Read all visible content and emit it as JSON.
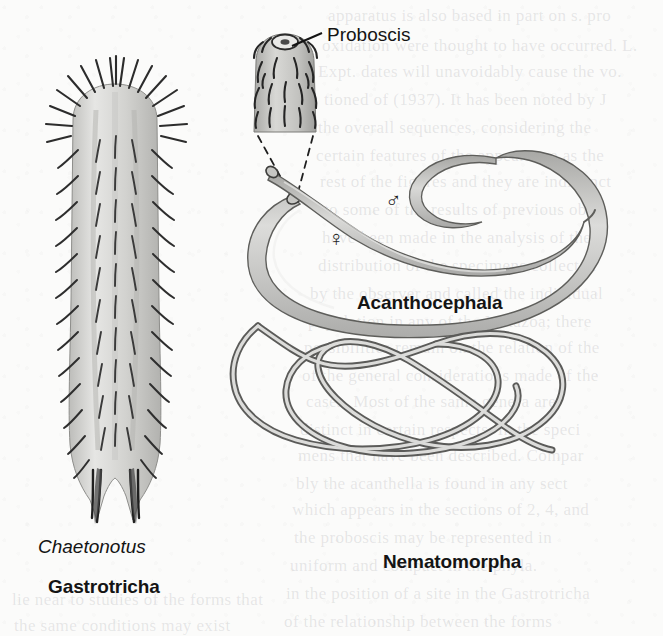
{
  "figure": {
    "background_color": "#fbfbfa",
    "ink_color": "#141414"
  },
  "callouts": [
    {
      "id": "proboscis",
      "text": "Proboscis",
      "x": 327,
      "y": 24
    }
  ],
  "specimens": [
    {
      "id": "gastrotricha",
      "genus_label": "Chaetonotus",
      "genus_x": 38,
      "genus_y": 536,
      "phylum_label": "Gastrotricha",
      "phylum_x": 48,
      "phylum_y": 576,
      "body_color": "#d9d9d7",
      "outline_color": "#3a3a3a"
    },
    {
      "id": "acanthocephala",
      "phylum_label": "Acanthocephala",
      "phylum_x": 357,
      "phylum_y": 292,
      "body_color": "#c9c9c6",
      "outline_color": "#5a5a58",
      "sex_symbols": [
        {
          "sex": "male",
          "glyph": "♂",
          "x": 385,
          "y": 188
        },
        {
          "sex": "female",
          "glyph": "♀",
          "x": 328,
          "y": 226
        }
      ]
    },
    {
      "id": "nematomorpha",
      "phylum_label": "Nematomorpha",
      "phylum_x": 383,
      "phylum_y": 551,
      "body_color": "#cfcfcc",
      "outline_color": "#606060"
    }
  ],
  "bleed_through_lines": [
    {
      "text": "apparatus is also based in part on s. pro",
      "x": 328,
      "y": 6
    },
    {
      "text": "oxidation were thought to have occurred. L.",
      "x": 322,
      "y": 36
    },
    {
      "text": "Expt. dates will unavoidably cause the vo.",
      "x": 318,
      "y": 62
    },
    {
      "text": "tioned of (1937). It has been noted by J",
      "x": 324,
      "y": 90
    },
    {
      "text": "the overall sequences, considering the",
      "x": 318,
      "y": 118
    },
    {
      "text": "certain features of the appearance as the",
      "x": 316,
      "y": 146
    },
    {
      "text": "rest of the figures and they are indistinct",
      "x": 320,
      "y": 172
    },
    {
      "text": "to some of the results of previous obs",
      "x": 324,
      "y": 200
    },
    {
      "text": "have been made in the analysis of the",
      "x": 322,
      "y": 228
    },
    {
      "text": "distribution of the specimens collected",
      "x": 318,
      "y": 256
    },
    {
      "text": "by the observer and called the individual",
      "x": 310,
      "y": 284
    },
    {
      "text": "population in any of the Metazoa; there",
      "x": 308,
      "y": 312
    },
    {
      "text": "possibilities remain on the relation of the",
      "x": 304,
      "y": 338
    },
    {
      "text": "of the general considerations made of the",
      "x": 302,
      "y": 366
    },
    {
      "text": "cases. Most of the same genera are",
      "x": 306,
      "y": 392
    },
    {
      "text": "distinct in certain respects. In the speci",
      "x": 300,
      "y": 420
    },
    {
      "text": "mens that have been described. Compar",
      "x": 298,
      "y": 446
    },
    {
      "text": "bly the acanthella is found in any sect",
      "x": 296,
      "y": 474
    },
    {
      "text": "which appears in the sections of 2, 4, and",
      "x": 292,
      "y": 500
    },
    {
      "text": "the proboscis may be represented in",
      "x": 294,
      "y": 528
    },
    {
      "text": "uniform and compact in the phyla.",
      "x": 290,
      "y": 556
    },
    {
      "text": "in the position of a site in the Gastrotricha",
      "x": 286,
      "y": 584
    },
    {
      "text": "of the relationship between the forms",
      "x": 284,
      "y": 612
    },
    {
      "text": "lie near to studies of the forms that",
      "x": 12,
      "y": 590
    },
    {
      "text": "the same conditions may exist",
      "x": 14,
      "y": 616
    }
  ]
}
